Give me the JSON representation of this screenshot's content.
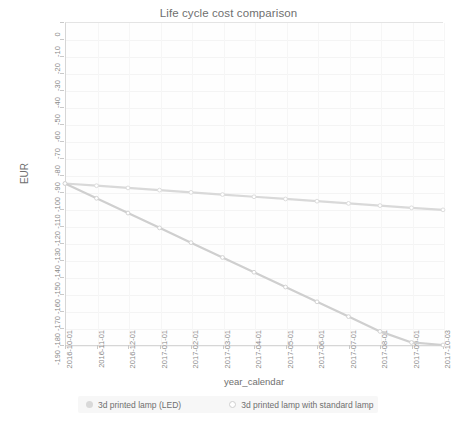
{
  "chart_data": {
    "type": "line",
    "title": "Life cycle cost comparison",
    "xlabel": "year_calendar",
    "ylabel": "EUR",
    "grid": true,
    "legend_position": "bottom",
    "ylim": [
      -190,
      0
    ],
    "ytick_labels": [
      "0",
      "-10",
      "-20",
      "-30",
      "-40",
      "-50",
      "-60",
      "-70",
      "-80",
      "-90",
      "-100",
      "-110",
      "-120",
      "-130",
      "-140",
      "-150",
      "-160",
      "-170",
      "-180",
      "-190"
    ],
    "ytick_values": [
      0,
      -10,
      -20,
      -30,
      -40,
      -50,
      -60,
      -70,
      -80,
      -90,
      -100,
      -110,
      -120,
      -130,
      -140,
      -150,
      -160,
      -170,
      -180,
      -190
    ],
    "x": [
      "2016-10-01",
      "2016-11-01",
      "2016-12-01",
      "2017-01-01",
      "2017-02-01",
      "2017-03-01",
      "2017-04-01",
      "2017-05-01",
      "2017-06-01",
      "2017-07-01",
      "2017-08-01",
      "2017-09-01",
      "2017-10-03"
    ],
    "xtick_labels": [
      "2016-10-01",
      "2016-11-01",
      "2016-12-01",
      "2017-01-01",
      "2017-02-01",
      "2017-03-01",
      "2017-04-01",
      "2017-05-01",
      "2017-06-01",
      "2017-07-01",
      "2017-08-01",
      "2017-09-01",
      "2017-10-03"
    ],
    "series": [
      {
        "name": "3d printed lamp (LED)",
        "color": "#d9d9d9",
        "marker": "circle",
        "values": [
          -95.0,
          -96.3,
          -97.6,
          -98.9,
          -100.2,
          -101.5,
          -102.8,
          -104.1,
          -105.4,
          -106.7,
          -108.0,
          -109.3,
          -110.5
        ]
      },
      {
        "name": "3d printed lamp with standard lamp",
        "color": "#cfcfcf",
        "marker": "circle",
        "values": [
          -95.0,
          -103.7,
          -112.4,
          -121.1,
          -129.8,
          -138.5,
          -147.2,
          -155.9,
          -164.6,
          -173.3,
          -182.0,
          -188.5,
          -190.0
        ]
      }
    ]
  },
  "legend": {
    "items": [
      {
        "label": "3d printed lamp (LED)"
      },
      {
        "label": "3d printed lamp with standard lamp"
      }
    ]
  },
  "colors": {
    "series_1": "#d9d9d9",
    "series_2": "#cfcfcf",
    "axis": "#c9c9c9",
    "grid": "#f4f4f4",
    "text": "#6f6f6f",
    "tick_text": "#8a8a8a",
    "legend_background": "#f7f7f7",
    "plot_background": "#fefefe"
  }
}
